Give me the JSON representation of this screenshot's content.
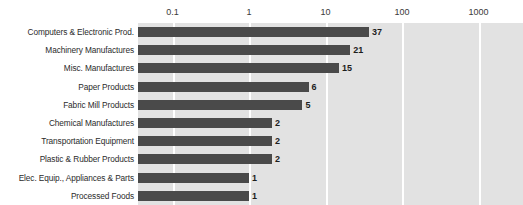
{
  "chart_data": {
    "type": "bar",
    "orientation": "horizontal",
    "title": "",
    "xlabel": "",
    "ylabel": "",
    "xscale": "log",
    "xlim": [
      0.03,
      10000
    ],
    "grid": true,
    "gridlines": [
      0.1,
      1,
      10,
      100,
      1000,
      10000
    ],
    "tick_labels": [
      "0.1",
      "1",
      "10",
      "100",
      "1000",
      "10000"
    ],
    "legend": "none",
    "categories": [
      "Computers & Electronic Prod.",
      "Machinery Manufactures",
      "Misc. Manufactures",
      "Paper Products",
      "Fabric Mill Products",
      "Chemical Manufactures",
      "Transportation Equipment",
      "Plastic & Rubber Products",
      "Elec. Equip., Appliances & Parts",
      "Processed Foods"
    ],
    "values": [
      37,
      21,
      15,
      6,
      5,
      2,
      2,
      2,
      1,
      1
    ],
    "value_labels": [
      "37",
      "21",
      "15",
      "6",
      "5",
      "2",
      "2",
      "2",
      "1",
      "1"
    ],
    "colors": {
      "bar": "#4a4a4a",
      "plot_background": "#e2e2e2",
      "gridline": "#ffffff",
      "page_background": "#ffffff",
      "label_text": "#2b2b2b",
      "value_text": "#1d1d1d",
      "tick_text": "#3a3a3a"
    }
  }
}
